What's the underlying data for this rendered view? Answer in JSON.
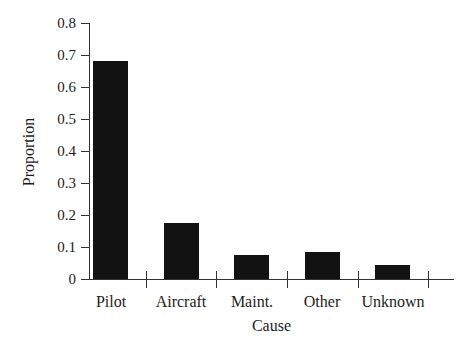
{
  "figure": {
    "background_color": "#ffffff",
    "bar_color": "#121212",
    "axis_color": "#333333",
    "text_color": "#1c1c1c"
  },
  "chart_data": {
    "type": "bar",
    "title": "",
    "xlabel": "Cause",
    "ylabel": "Proportion",
    "categories": [
      "Pilot",
      "Aircraft",
      "Maint.",
      "Other",
      "Unknown"
    ],
    "values": [
      0.68,
      0.175,
      0.075,
      0.085,
      0.045
    ],
    "ylim": [
      0,
      0.8
    ],
    "ytick_step": 0.1,
    "ytick_labels": [
      "0",
      "0.1",
      "0.2",
      "0.3",
      "0.4",
      "0.5",
      "0.6",
      "0.7",
      "0.8"
    ],
    "grid": false,
    "legend_position": "none"
  }
}
